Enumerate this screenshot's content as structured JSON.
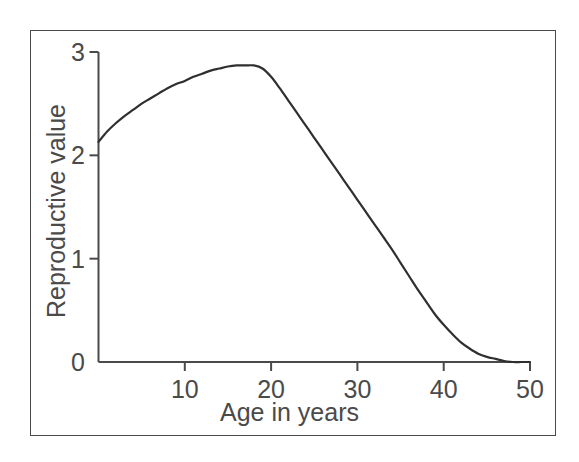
{
  "figure": {
    "background_color": "#ffffff",
    "frame_color": "#4a4a4a",
    "axis_color": "#4a4a4a",
    "curve_color": "#2f2f2f"
  },
  "chart_data": {
    "type": "line",
    "title": "",
    "subtitle": "",
    "xlabel": "Age in years",
    "ylabel": "Reproductive value",
    "xlim": [
      0,
      50
    ],
    "ylim": [
      0,
      3
    ],
    "xticks": [
      10,
      20,
      30,
      40,
      50
    ],
    "xtick_labels": [
      "10",
      "20",
      "30",
      "40",
      "50"
    ],
    "yticks": [
      0,
      1,
      2,
      3
    ],
    "ytick_labels": [
      "0",
      "1",
      "2",
      "3"
    ],
    "grid": false,
    "legend": null,
    "annotations": [],
    "series": [
      {
        "name": "Reproductive value",
        "x": [
          0,
          1,
          2,
          3,
          4,
          5,
          6,
          7,
          8,
          9,
          10,
          11,
          12,
          13,
          14,
          15,
          16,
          17,
          18,
          19,
          20,
          21,
          22,
          23,
          24,
          25,
          26,
          27,
          28,
          29,
          30,
          31,
          32,
          33,
          34,
          35,
          36,
          37,
          38,
          39,
          40,
          41,
          42,
          43,
          44,
          45,
          46,
          47,
          48,
          49,
          50
        ],
        "y": [
          2.13,
          2.23,
          2.31,
          2.38,
          2.44,
          2.5,
          2.55,
          2.6,
          2.65,
          2.69,
          2.72,
          2.76,
          2.79,
          2.82,
          2.84,
          2.86,
          2.87,
          2.87,
          2.87,
          2.84,
          2.76,
          2.65,
          2.53,
          2.41,
          2.29,
          2.17,
          2.05,
          1.93,
          1.81,
          1.69,
          1.57,
          1.45,
          1.33,
          1.21,
          1.09,
          0.96,
          0.83,
          0.7,
          0.58,
          0.46,
          0.36,
          0.27,
          0.19,
          0.13,
          0.08,
          0.05,
          0.03,
          0.01,
          0.0,
          0.0,
          0.0
        ]
      }
    ]
  },
  "geometry": {
    "x_axis_px": {
      "x0": 98.5,
      "x50": 530.0
    },
    "y_axis_px": {
      "y0": 362.0,
      "y3": 52.0
    }
  }
}
